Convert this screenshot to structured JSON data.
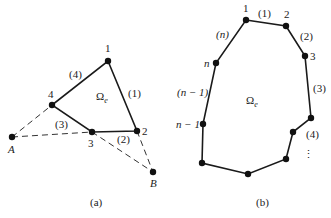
{
  "figure_a": {
    "caption": "(a)",
    "region_label": "Ω",
    "region_sub": "e",
    "nodes": [
      {
        "id": "1",
        "label": "1",
        "x": 108,
        "y": 61,
        "lx": 105,
        "ly": 52
      },
      {
        "id": "2",
        "label": "2",
        "x": 137,
        "y": 131,
        "lx": 142,
        "ly": 135
      },
      {
        "id": "3",
        "label": "3",
        "x": 92,
        "y": 132,
        "lx": 88,
        "ly": 147
      },
      {
        "id": "4",
        "label": "4",
        "x": 52,
        "y": 105,
        "lx": 48,
        "ly": 98
      }
    ],
    "edge_labels": [
      {
        "label": "(1)",
        "x": 128,
        "y": 97
      },
      {
        "label": "(2)",
        "x": 117,
        "y": 143
      },
      {
        "label": "(3)",
        "x": 55,
        "y": 128
      },
      {
        "label": "(4)",
        "x": 69,
        "y": 78
      }
    ],
    "external_points": [
      {
        "id": "A",
        "label": "A",
        "x": 12,
        "y": 137,
        "lx": 8,
        "ly": 153
      },
      {
        "id": "B",
        "label": "B",
        "x": 153,
        "y": 172,
        "lx": 150,
        "ly": 187
      }
    ]
  },
  "figure_b": {
    "caption": "(b)",
    "region_label": "Ω",
    "region_sub": "e",
    "nodes": [
      {
        "id": "1",
        "label": "1",
        "x": 246,
        "y": 20,
        "lx": 243,
        "ly": 12
      },
      {
        "id": "2",
        "label": "2",
        "x": 286,
        "y": 26,
        "lx": 284,
        "ly": 18
      },
      {
        "id": "3",
        "label": "3",
        "x": 305,
        "y": 56,
        "lx": 310,
        "ly": 60
      },
      {
        "id": "r4",
        "label": "",
        "x": 311,
        "y": 118
      },
      {
        "id": "r5",
        "label": "",
        "x": 293,
        "y": 132
      },
      {
        "id": "r6",
        "label": "",
        "x": 286,
        "y": 159
      },
      {
        "id": "bot",
        "label": "",
        "x": 248,
        "y": 174
      },
      {
        "id": "bl",
        "label": "",
        "x": 202,
        "y": 163
      },
      {
        "id": "n-1",
        "label": "n − 1",
        "x": 203,
        "y": 124,
        "lx": 176,
        "ly": 128
      },
      {
        "id": "n",
        "label": "n",
        "x": 216,
        "y": 63,
        "lx": 204,
        "ly": 67
      }
    ],
    "edge_labels": [
      {
        "label": "(1)",
        "x": 258,
        "y": 17
      },
      {
        "label": "(2)",
        "x": 300,
        "y": 40
      },
      {
        "label": "(3)",
        "x": 313,
        "y": 92
      },
      {
        "label": "(4)",
        "x": 306,
        "y": 138
      },
      {
        "label": "(n)",
        "x": 216,
        "y": 38
      },
      {
        "label": "(n − 1)",
        "x": 177,
        "y": 96
      }
    ],
    "continuation": "⋮"
  }
}
